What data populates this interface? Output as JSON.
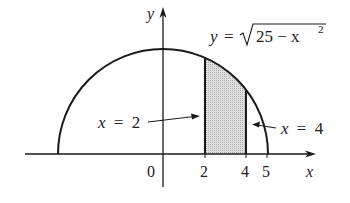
{
  "figure": {
    "equation": {
      "lhs": "y",
      "eq": "=",
      "radicand": "25 − x",
      "exponent": "2"
    },
    "axes": {
      "x_label": "x",
      "y_label": "y",
      "origin_label": "0",
      "ticks": [
        "2",
        "4",
        "5"
      ]
    },
    "annotations": {
      "left_line": {
        "var": "x",
        "eq": "=",
        "val": "2"
      },
      "right_line": {
        "var": "x",
        "eq": "=",
        "val": "4"
      }
    },
    "colors": {
      "stroke": "#1a1a1a",
      "shade": "#d0d0d0"
    }
  }
}
